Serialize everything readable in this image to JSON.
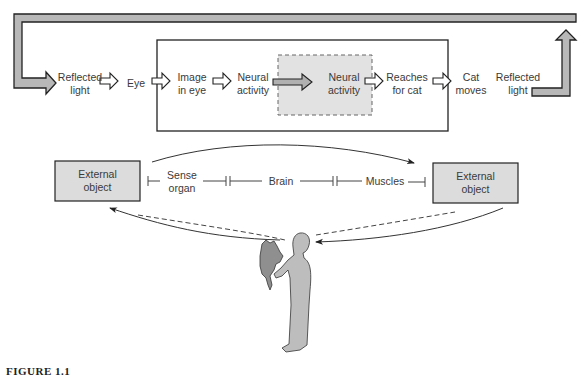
{
  "top_flow": {
    "steps": [
      {
        "id": "reflected-light-in",
        "label_line1": "Reflected",
        "label_line2": "light"
      },
      {
        "id": "eye",
        "label_line1": "Eye",
        "label_line2": ""
      },
      {
        "id": "image-in-eye",
        "label_line1": "Image",
        "label_line2": "in eye"
      },
      {
        "id": "neural-activity-1",
        "label_line1": "Neural",
        "label_line2": "activity"
      },
      {
        "id": "neural-activity-2",
        "label_line1": "Neural",
        "label_line2": "activity"
      },
      {
        "id": "reaches-for-cat",
        "label_line1": "Reaches",
        "label_line2": "for cat"
      },
      {
        "id": "cat-moves",
        "label_line1": "Cat",
        "label_line2": "moves"
      },
      {
        "id": "reflected-light-out",
        "label_line1": "Reflected",
        "label_line2": "light"
      }
    ]
  },
  "bottom_chain": {
    "left_object": {
      "line1": "External",
      "line2": "object"
    },
    "right_object": {
      "line1": "External",
      "line2": "object"
    },
    "segments": [
      {
        "line1": "Sense",
        "line2": "organ"
      },
      {
        "line1": "Brain",
        "line2": ""
      },
      {
        "line1": "Muscles",
        "line2": ""
      }
    ]
  },
  "colors": {
    "box_fill": "#dcdcdc",
    "arrow_fill": "#b8b8b8",
    "outline": "#222222",
    "figure_fill": "#bdbdbd"
  },
  "caption": "FIGURE 1.1"
}
